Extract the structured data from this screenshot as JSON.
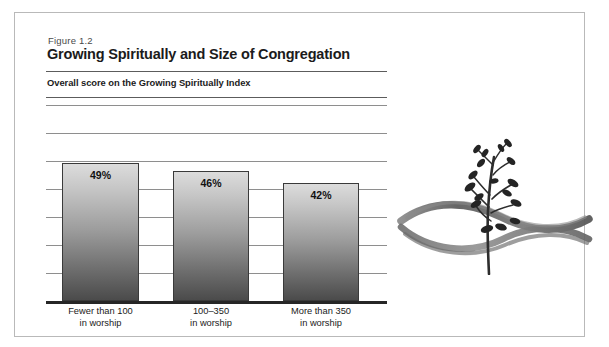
{
  "figure": {
    "number": "Figure 1.2",
    "title": "Growing Spiritually and Size of Congregation",
    "subtitle": "Overall score on the Growing Spiritually Index"
  },
  "illustration": {
    "name": "sapling-with-brush-ribbons",
    "description": "Brush-stroke drawing of a young leafy plant above two crossing ribbon strokes"
  },
  "colors": {
    "frame_border": "#b9b9b9",
    "rule": "#5c5c5c",
    "gridline": "#8e8e8e",
    "axis": "#262626",
    "bar_top": "#dcdcdc",
    "bar_bottom": "#4b4b4b",
    "bar_border": "#3a3a3a",
    "text": "#1b1b1b",
    "ink": "#5a5a5a"
  },
  "chart_data": {
    "type": "bar",
    "title": "Growing Spiritually and Size of Congregation",
    "subtitle": "Overall score on the Growing Spiritually Index",
    "categories": [
      "Fewer than 100\nin worship",
      "100–350\nin worship",
      "More than 350\nin worship"
    ],
    "category_lines": [
      [
        "Fewer than 100",
        "in worship"
      ],
      [
        "100–350",
        "in worship"
      ],
      [
        "More than 350",
        "in worship"
      ]
    ],
    "values": [
      49,
      46,
      42
    ],
    "value_labels": [
      "49%",
      "46%",
      "42%"
    ],
    "xlabel": "",
    "ylabel": "",
    "ylim": [
      0,
      70
    ],
    "grid": true,
    "gridline_count": 7,
    "legend": "none",
    "axis_tick_labels": []
  }
}
